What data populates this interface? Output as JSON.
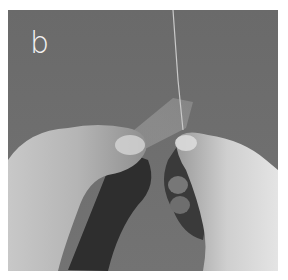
{
  "figure": {
    "panel_label": "b",
    "colors": {
      "background": "#6b6b6b",
      "border": "#ffffff",
      "label": "#f2f2f2"
    }
  }
}
